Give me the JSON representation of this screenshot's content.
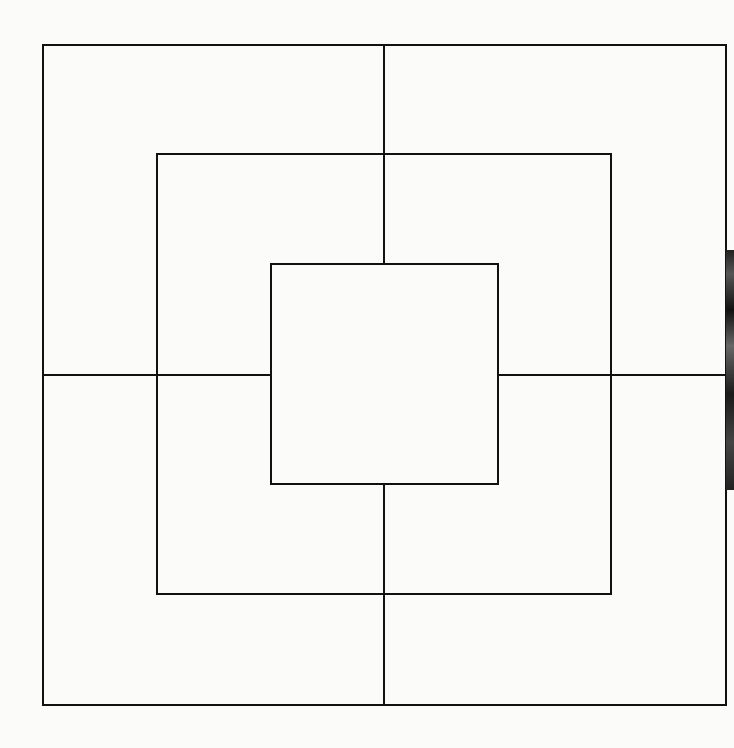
{
  "diagram": {
    "title": "",
    "type": "nine-mens-morris-board",
    "stroke_color": "#111111",
    "background_color": "#fbfbfa",
    "squares": [
      {
        "name": "outer",
        "x1": 43,
        "y1": 45,
        "x2": 726,
        "y2": 705
      },
      {
        "name": "middle",
        "x1": 157,
        "y1": 154,
        "x2": 611,
        "y2": 594
      },
      {
        "name": "inner",
        "x1": 271,
        "y1": 264,
        "x2": 498,
        "y2": 484
      }
    ],
    "connectors": [
      {
        "name": "top",
        "x1": 384,
        "y1": 45,
        "x2": 384,
        "y2": 264
      },
      {
        "name": "bottom",
        "x1": 384,
        "y1": 484,
        "x2": 384,
        "y2": 705
      },
      {
        "name": "left",
        "x1": 43,
        "y1": 375,
        "x2": 271,
        "y2": 375
      },
      {
        "name": "right",
        "x1": 498,
        "y1": 375,
        "x2": 726,
        "y2": 375
      }
    ]
  }
}
